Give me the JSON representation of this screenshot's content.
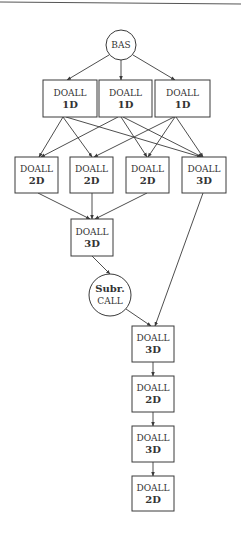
{
  "diagram": {
    "type": "dataflow-graph",
    "nodes": [
      {
        "id": "bas",
        "shape": "circle",
        "lines": [
          "BAS"
        ],
        "cx": 121,
        "cy": 45,
        "r": 15
      },
      {
        "id": "d1a",
        "shape": "box",
        "lines": [
          "DOALL",
          "1D"
        ],
        "x": 43,
        "y": 80,
        "w": 54,
        "h": 37
      },
      {
        "id": "d1b",
        "shape": "box",
        "lines": [
          "DOALL",
          "1D"
        ],
        "x": 99,
        "y": 80,
        "w": 53,
        "h": 37
      },
      {
        "id": "d1c",
        "shape": "box",
        "lines": [
          "DOALL",
          "1D"
        ],
        "x": 155,
        "y": 80,
        "w": 55,
        "h": 37
      },
      {
        "id": "d2a",
        "shape": "box",
        "lines": [
          "DOALL",
          "2D"
        ],
        "x": 15,
        "y": 157,
        "w": 43,
        "h": 36
      },
      {
        "id": "d2b",
        "shape": "box",
        "lines": [
          "DOALL",
          "2D"
        ],
        "x": 70,
        "y": 157,
        "w": 43,
        "h": 36
      },
      {
        "id": "d2c",
        "shape": "box",
        "lines": [
          "DOALL",
          "2D"
        ],
        "x": 126,
        "y": 157,
        "w": 43,
        "h": 36
      },
      {
        "id": "d3a",
        "shape": "box",
        "lines": [
          "DOALL",
          "3D"
        ],
        "x": 182,
        "y": 157,
        "w": 44,
        "h": 36
      },
      {
        "id": "d3b",
        "shape": "box",
        "lines": [
          "DOALL",
          "3D"
        ],
        "x": 71,
        "y": 219,
        "w": 42,
        "h": 37
      },
      {
        "id": "subr",
        "shape": "circle",
        "lines": [
          "Subr.",
          "CALL"
        ],
        "cx": 110,
        "cy": 295,
        "r": 21
      },
      {
        "id": "d3c",
        "shape": "box",
        "lines": [
          "DOALL",
          "3D"
        ],
        "x": 132,
        "y": 326,
        "w": 42,
        "h": 36
      },
      {
        "id": "d2d",
        "shape": "box",
        "lines": [
          "DOALL",
          "2D"
        ],
        "x": 132,
        "y": 376,
        "w": 42,
        "h": 36
      },
      {
        "id": "d3d",
        "shape": "box",
        "lines": [
          "DOALL",
          "3D"
        ],
        "x": 132,
        "y": 426,
        "w": 42,
        "h": 36
      },
      {
        "id": "d2e",
        "shape": "box",
        "lines": [
          "DOALL",
          "2D"
        ],
        "x": 132,
        "y": 476,
        "w": 42,
        "h": 35
      }
    ],
    "edges": [
      {
        "from": "bas",
        "to": "d1a",
        "x1": 109,
        "y1": 55,
        "x2": 67,
        "y2": 80
      },
      {
        "from": "bas",
        "to": "d1b",
        "x1": 121,
        "y1": 60,
        "x2": 121,
        "y2": 80
      },
      {
        "from": "bas",
        "to": "d1c",
        "x1": 133,
        "y1": 55,
        "x2": 175,
        "y2": 80
      },
      {
        "from": "d1a",
        "to": "d2a",
        "x1": 63,
        "y1": 117,
        "x2": 39,
        "y2": 157
      },
      {
        "from": "d1a",
        "to": "d2b",
        "x1": 63,
        "y1": 117,
        "x2": 92,
        "y2": 157
      },
      {
        "from": "d1a",
        "to": "d3a",
        "x1": 66,
        "y1": 117,
        "x2": 201,
        "y2": 157
      },
      {
        "from": "d1b",
        "to": "d2a",
        "x1": 118,
        "y1": 117,
        "x2": 41,
        "y2": 157
      },
      {
        "from": "d1b",
        "to": "d2c",
        "x1": 121,
        "y1": 117,
        "x2": 147,
        "y2": 157
      },
      {
        "from": "d1b",
        "to": "d3a",
        "x1": 123,
        "y1": 117,
        "x2": 202,
        "y2": 157
      },
      {
        "from": "d1c",
        "to": "d2b",
        "x1": 174,
        "y1": 117,
        "x2": 94,
        "y2": 157
      },
      {
        "from": "d1c",
        "to": "d2c",
        "x1": 175,
        "y1": 117,
        "x2": 148,
        "y2": 157
      },
      {
        "from": "d1c",
        "to": "d3a",
        "x1": 176,
        "y1": 117,
        "x2": 203,
        "y2": 157
      },
      {
        "from": "d2a",
        "to": "d3b",
        "x1": 38,
        "y1": 193,
        "x2": 90,
        "y2": 219
      },
      {
        "from": "d2b",
        "to": "d3b",
        "x1": 92,
        "y1": 193,
        "x2": 92,
        "y2": 219
      },
      {
        "from": "d2c",
        "to": "d3b",
        "x1": 147,
        "y1": 193,
        "x2": 95,
        "y2": 219
      },
      {
        "from": "d3b",
        "to": "subr",
        "x1": 92,
        "y1": 256,
        "x2": 110,
        "y2": 274
      },
      {
        "from": "subr",
        "to": "d3c",
        "x1": 126,
        "y1": 309,
        "x2": 151,
        "y2": 326
      },
      {
        "from": "d3a",
        "to": "d3c",
        "x1": 203,
        "y1": 193,
        "x2": 155,
        "y2": 326
      },
      {
        "from": "d3c",
        "to": "d2d",
        "x1": 153,
        "y1": 362,
        "x2": 153,
        "y2": 376
      },
      {
        "from": "d2d",
        "to": "d3d",
        "x1": 153,
        "y1": 412,
        "x2": 153,
        "y2": 426
      },
      {
        "from": "d3d",
        "to": "d2e",
        "x1": 153,
        "y1": 462,
        "x2": 153,
        "y2": 476
      }
    ]
  },
  "colors": {
    "stroke": "#3a3a3a",
    "text": "#333333",
    "background": "#ffffff",
    "rule": "#555555"
  }
}
